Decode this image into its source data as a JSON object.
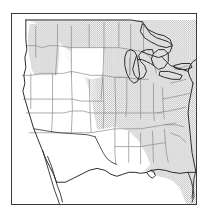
{
  "figure": {
    "type": "map",
    "title": "",
    "caption": "",
    "frame": {
      "x": 11,
      "y": 13,
      "width": 186,
      "height": 192,
      "border_color": "#3a3a3a"
    }
  },
  "map": {
    "region_name": "contiguous-united-states",
    "projection_hint": "conic",
    "background_color": "#ffffff",
    "state_border_color": "#8a8a8a",
    "coastline_color": "#2b2b2b",
    "lake_fill_color": "#ffffff",
    "shading": {
      "style": "stipple",
      "dot_color": "#b8b8b8",
      "dot_pitch_px": 2,
      "legend_label": "",
      "shaded_description": "northern and eastern states",
      "unshaded_description": "western, southwestern states and Texas"
    },
    "shaded_areas": [
      "pacific-northwest",
      "northern-rockies",
      "northern-plains",
      "midwest",
      "great-lakes",
      "ohio-valley",
      "appalachia",
      "southeast",
      "gulf-south",
      "mid-atlantic",
      "northeast"
    ],
    "unshaded_areas": [
      "california",
      "nevada",
      "utah",
      "arizona",
      "new-mexico",
      "colorado",
      "wyoming",
      "western-kansas",
      "oklahoma-panhandle",
      "texas"
    ],
    "water_features": [
      "lake-superior",
      "lake-michigan",
      "lake-huron",
      "lake-erie",
      "lake-ontario",
      "gulf-of-mexico",
      "atlantic-ocean",
      "pacific-ocean"
    ],
    "land_features": [
      "baja-california-peninsula",
      "florida-peninsula",
      "cape-cod",
      "long-island",
      "chesapeake-bay"
    ]
  }
}
